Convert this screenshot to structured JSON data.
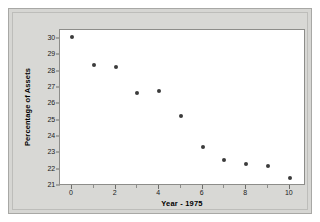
{
  "chart_data": {
    "type": "scatter",
    "title": "",
    "xlabel": "Year - 1975",
    "ylabel": "Percentage of Assets",
    "x": [
      0,
      1,
      2,
      3,
      4,
      5,
      6,
      7,
      8,
      9,
      10
    ],
    "values": [
      30.1,
      28.4,
      28.3,
      26.7,
      26.8,
      25.3,
      23.4,
      22.6,
      22.35,
      22.25,
      21.5
    ],
    "series": [
      {
        "name": "Percentage of Assets",
        "values": [
          30.1,
          28.4,
          28.3,
          26.7,
          26.8,
          25.3,
          23.4,
          22.6,
          22.35,
          22.25,
          21.5
        ]
      }
    ],
    "xlim": [
      -0.55,
      10.75
    ],
    "ylim": [
      21,
      30.55
    ],
    "xticks": [
      0,
      2,
      4,
      6,
      8,
      10
    ],
    "xtick_labels": [
      "0",
      "2",
      "4",
      "6",
      "8",
      "10"
    ],
    "x_minor_ticks": [
      1,
      3,
      5,
      7,
      9
    ],
    "yticks": [
      21,
      22,
      23,
      24,
      25,
      26,
      27,
      28,
      29,
      30
    ],
    "ytick_labels": [
      "21",
      "22",
      "23",
      "24",
      "25",
      "26",
      "27",
      "28",
      "29",
      "30"
    ],
    "grid": false,
    "legend": null,
    "marker_color": "#3b3b3b",
    "plot_background": "#ffffff",
    "panel_background": "#d8d8d5"
  }
}
